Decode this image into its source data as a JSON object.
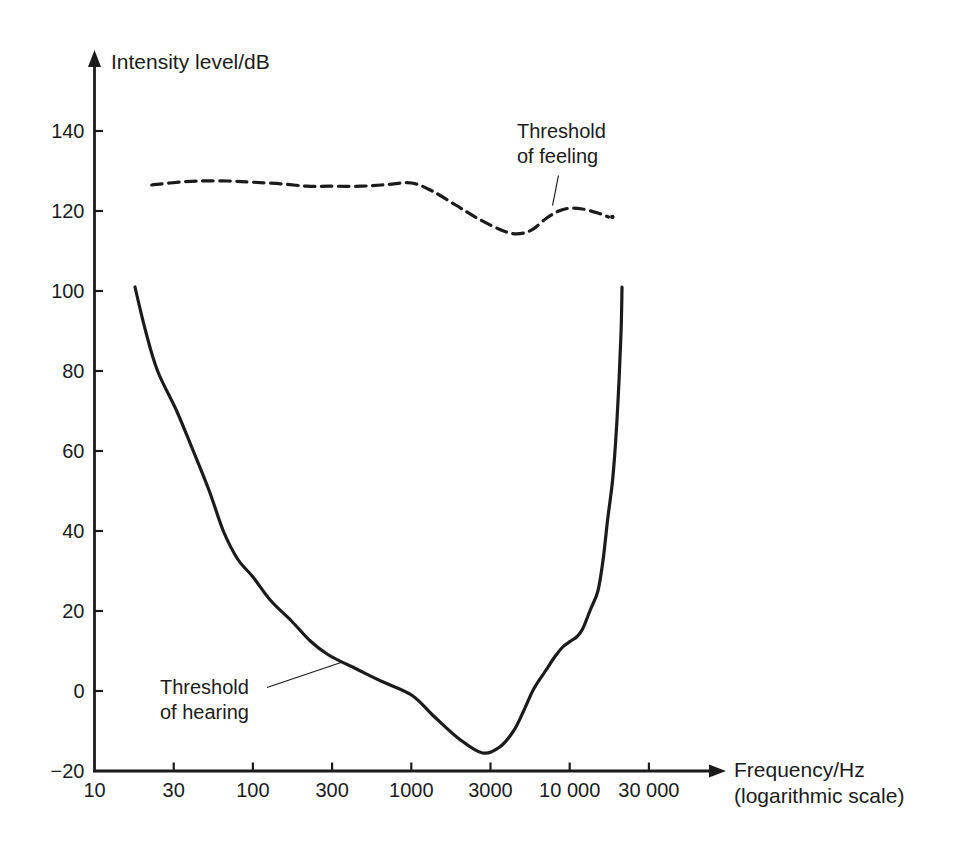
{
  "figure": {
    "background": "#ffffff",
    "ink_color": "#1b1b1b",
    "y_axis": {
      "title": "Intensity level/dB",
      "tick_labels": [
        "140",
        "120",
        "100",
        "80",
        "60",
        "40",
        "20",
        "0",
        "−20"
      ],
      "tick_values": [
        140,
        120,
        100,
        80,
        60,
        40,
        20,
        0,
        -20
      ]
    },
    "x_axis": {
      "title": "Frequency/Hz",
      "subtitle": "(logarithmic scale)",
      "tick_labels": [
        "10",
        "30",
        "100",
        "300",
        "1000",
        "3000",
        "10 000",
        "30 000"
      ],
      "tick_values": [
        10,
        30,
        100,
        300,
        1000,
        3000,
        10000,
        30000
      ]
    },
    "annotations": {
      "feeling": {
        "line1": "Threshold",
        "line2": "of feeling"
      },
      "hearing": {
        "line1": "Threshold",
        "line2": "of hearing"
      }
    }
  },
  "chart_data": {
    "type": "line",
    "title": "",
    "xlabel": "Frequency/Hz (logarithmic scale)",
    "ylabel": "Intensity level/dB",
    "x_scale": "log",
    "xlim": [
      10,
      50000
    ],
    "ylim": [
      -20,
      150
    ],
    "grid": false,
    "legend": "inline-annotations",
    "series": [
      {
        "name": "Threshold of feeling",
        "style": "dashed",
        "points_hz_db": [
          [
            23,
            126.5
          ],
          [
            30,
            127
          ],
          [
            45,
            127.5
          ],
          [
            70,
            127.5
          ],
          [
            100,
            127.2
          ],
          [
            150,
            126.8
          ],
          [
            220,
            126.2
          ],
          [
            300,
            126.2
          ],
          [
            480,
            126.2
          ],
          [
            700,
            126.6
          ],
          [
            1000,
            127
          ],
          [
            1350,
            125
          ],
          [
            1900,
            121.5
          ],
          [
            2600,
            118.2
          ],
          [
            3700,
            115.2
          ],
          [
            4600,
            114.3
          ],
          [
            5700,
            115.2
          ],
          [
            7100,
            118.2
          ],
          [
            8500,
            120
          ],
          [
            10000,
            120.7
          ],
          [
            12000,
            120.5
          ],
          [
            15000,
            119.5
          ],
          [
            17500,
            118.5
          ]
        ],
        "end_dot_hz_db": [
          18500,
          118.5
        ]
      },
      {
        "name": "Threshold of hearing",
        "style": "solid",
        "points_hz_db": [
          [
            18,
            101
          ],
          [
            21,
            90
          ],
          [
            25,
            80
          ],
          [
            33,
            70
          ],
          [
            42,
            60
          ],
          [
            53,
            50
          ],
          [
            65,
            40
          ],
          [
            80,
            33
          ],
          [
            100,
            28.5
          ],
          [
            130,
            22.5
          ],
          [
            175,
            17.5
          ],
          [
            230,
            12.5
          ],
          [
            300,
            9
          ],
          [
            450,
            5.5
          ],
          [
            640,
            2.5
          ],
          [
            1000,
            -1
          ],
          [
            1400,
            -6.5
          ],
          [
            2000,
            -12
          ],
          [
            2800,
            -15.5
          ],
          [
            3600,
            -14
          ],
          [
            4400,
            -10
          ],
          [
            5100,
            -5
          ],
          [
            5900,
            0.5
          ],
          [
            7000,
            5
          ],
          [
            8000,
            8.5
          ],
          [
            9000,
            11
          ],
          [
            10100,
            12.5
          ],
          [
            11000,
            13.5
          ],
          [
            12000,
            15.5
          ],
          [
            13500,
            20.5
          ],
          [
            15000,
            25
          ],
          [
            16200,
            33
          ],
          [
            17300,
            43
          ],
          [
            18600,
            53
          ],
          [
            19600,
            65
          ],
          [
            20400,
            78
          ],
          [
            21000,
            90
          ],
          [
            21300,
            101
          ]
        ]
      }
    ]
  }
}
